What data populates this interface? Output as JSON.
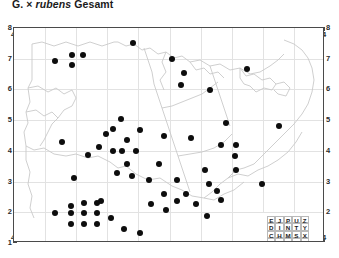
{
  "title": {
    "genus_abbrev": "G.",
    "hybrid_sign": "×",
    "epithet": "rubens",
    "suffix": "Gesamt",
    "full": "G. × rubens Gesamt"
  },
  "colors": {
    "dot": "#0d0d0d",
    "frame": "#4a4a4a",
    "grid": "#e2e2e2",
    "coastline": "#c4c4c4",
    "background": "#ffffff",
    "text": "#1c1c1c"
  },
  "axes": {
    "top_labels": [
      "4",
      "5",
      "6",
      "7",
      "8",
      "9",
      "0",
      "1",
      "2",
      "3",
      "4"
    ],
    "bottom_labels": [
      "4",
      "5",
      "6",
      "7",
      "8",
      "9",
      "0",
      "1",
      "2",
      "3",
      "4"
    ],
    "left_labels": [
      "8",
      "7",
      "6",
      "5",
      "4",
      "3",
      "2",
      "1"
    ],
    "right_labels": [
      "8",
      "7",
      "6",
      "5",
      "4",
      "3",
      "2"
    ]
  },
  "legend": {
    "name": "mtb-quadrant-key",
    "rows": [
      [
        "E",
        "J",
        "P",
        "U",
        "Z"
      ],
      [
        "D",
        "I",
        "N",
        "T",
        "Y"
      ],
      [
        "C",
        "H",
        "M",
        "S",
        "X"
      ],
      [
        "B",
        "G",
        "L",
        "R",
        "W"
      ],
      [
        "A",
        "F",
        "K",
        "Q",
        "V"
      ]
    ]
  },
  "chart_data": {
    "type": "scatter",
    "title": "G. × rubens Gesamt",
    "xlabel": "",
    "ylabel": "",
    "xlim": [
      0,
      311
    ],
    "ylim": [
      0,
      215
    ],
    "grid": true,
    "legend_position": "bottom-right",
    "marker": "filled-circle",
    "marker_size_px": 6,
    "point_count": 62,
    "points": [
      [
        119,
        15
      ],
      [
        41,
        33
      ],
      [
        58,
        27
      ],
      [
        69,
        27
      ],
      [
        58,
        37
      ],
      [
        158,
        31
      ],
      [
        170,
        45
      ],
      [
        167,
        57
      ],
      [
        196,
        62
      ],
      [
        233,
        41
      ],
      [
        107,
        91
      ],
      [
        126,
        102
      ],
      [
        113,
        112
      ],
      [
        150,
        108
      ],
      [
        48,
        114
      ],
      [
        74,
        127
      ],
      [
        212,
        95
      ],
      [
        177,
        110
      ],
      [
        207,
        117
      ],
      [
        222,
        117
      ],
      [
        221,
        128
      ],
      [
        265,
        98
      ],
      [
        222,
        142
      ],
      [
        85,
        119
      ],
      [
        92,
        106
      ],
      [
        99,
        101
      ],
      [
        99,
        123
      ],
      [
        108,
        123
      ],
      [
        122,
        123
      ],
      [
        113,
        136
      ],
      [
        145,
        136
      ],
      [
        191,
        142
      ],
      [
        135,
        152
      ],
      [
        163,
        152
      ],
      [
        60,
        150
      ],
      [
        103,
        145
      ],
      [
        118,
        148
      ],
      [
        195,
        156
      ],
      [
        203,
        163
      ],
      [
        248,
        156
      ],
      [
        150,
        166
      ],
      [
        172,
        166
      ],
      [
        87,
        173
      ],
      [
        57,
        178
      ],
      [
        70,
        175
      ],
      [
        83,
        175
      ],
      [
        41,
        185
      ],
      [
        57,
        185
      ],
      [
        70,
        185
      ],
      [
        83,
        185
      ],
      [
        57,
        196
      ],
      [
        70,
        196
      ],
      [
        83,
        196
      ],
      [
        97,
        190
      ],
      [
        110,
        201
      ],
      [
        152,
        182
      ],
      [
        163,
        173
      ],
      [
        182,
        176
      ],
      [
        193,
        188
      ],
      [
        207,
        172
      ],
      [
        126,
        205
      ],
      [
        137,
        176
      ]
    ]
  }
}
